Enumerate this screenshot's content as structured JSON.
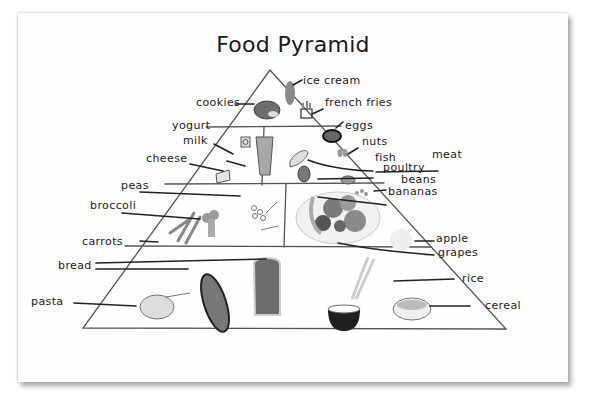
{
  "title": "Food Pyramid",
  "tiers": [
    {
      "name": "top",
      "labels": {
        "ice_cream": "ice cream",
        "cookies": "cookies",
        "french_fries": "french fries"
      }
    },
    {
      "name": "dairy-and-protein",
      "labels": {
        "yogurt": "yogurt",
        "milk": "milk",
        "cheese": "cheese",
        "eggs": "eggs",
        "nuts": "nuts",
        "fish": "fish",
        "meat": "meat",
        "poultry": "poultry",
        "beans": "beans"
      }
    },
    {
      "name": "vegetables-and-fruits",
      "labels": {
        "peas": "peas",
        "broccoli": "broccoli",
        "carrots": "carrots",
        "bananas": "bananas",
        "apple": "apple",
        "grapes": "grapes"
      }
    },
    {
      "name": "grains",
      "labels": {
        "bread": "bread",
        "pasta": "pasta",
        "rice": "rice",
        "cereal": "cereal"
      }
    }
  ]
}
